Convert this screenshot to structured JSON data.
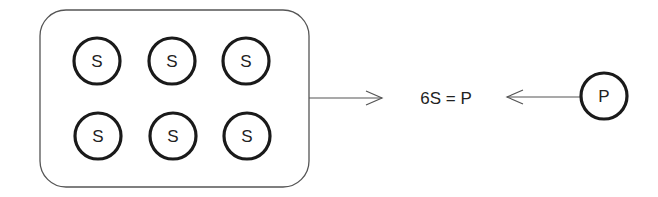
{
  "diagram": {
    "group_nodes": [
      {
        "label": "S"
      },
      {
        "label": "S"
      },
      {
        "label": "S"
      },
      {
        "label": "S"
      },
      {
        "label": "S"
      },
      {
        "label": "S"
      }
    ],
    "equation": "6S = P",
    "single_node": {
      "label": "P"
    },
    "colors": {
      "stroke": "#1a1a1a",
      "thin_line": "#555555",
      "background": "#ffffff"
    }
  }
}
